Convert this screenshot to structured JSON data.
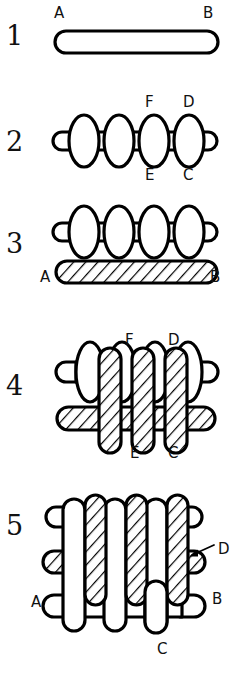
{
  "figure": {
    "background_color": "#ffffff",
    "ink_color": "#000000",
    "steps": [
      {
        "number": "1",
        "name": "single-horizontal-strand",
        "labels": [
          {
            "text": "A",
            "position": "top-left"
          },
          {
            "text": "B",
            "position": "top-right"
          }
        ],
        "fill_style": "plain"
      },
      {
        "number": "2",
        "name": "serpentine-strand",
        "labels": [
          {
            "text": "F",
            "position": "top"
          },
          {
            "text": "D",
            "position": "top"
          },
          {
            "text": "E",
            "position": "bottom"
          },
          {
            "text": "C",
            "position": "bottom"
          }
        ],
        "fill_style": "plain",
        "loop_count": 4
      },
      {
        "number": "3",
        "name": "serpentine-over-hatched-bar",
        "labels": [
          {
            "text": "A",
            "position": "bottom-left"
          },
          {
            "text": "B",
            "position": "bottom-right"
          }
        ],
        "fill_style": "hatched-bar"
      },
      {
        "number": "4",
        "name": "interwoven-vertical-strands",
        "labels": [
          {
            "text": "F",
            "position": "top"
          },
          {
            "text": "D",
            "position": "top"
          },
          {
            "text": "E",
            "position": "bottom"
          },
          {
            "text": "C",
            "position": "bottom"
          }
        ],
        "fill_style": "hatched-verticals"
      },
      {
        "number": "5",
        "name": "completed-woven-lattice",
        "labels": [
          {
            "text": "D",
            "position": "right",
            "has_arrow": true
          },
          {
            "text": "A",
            "position": "left"
          },
          {
            "text": "B",
            "position": "right"
          },
          {
            "text": "C",
            "position": "bottom"
          }
        ],
        "fill_style": "full-weave"
      }
    ]
  }
}
